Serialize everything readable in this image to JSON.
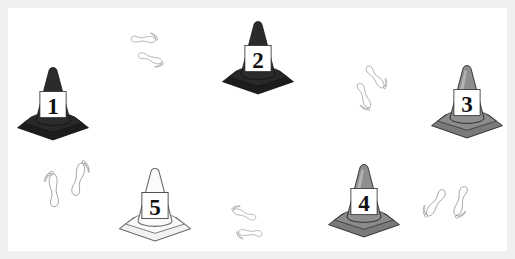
{
  "scene": {
    "title": "Numbered traffic cones and footprint pairs",
    "background_color": "#ffffff",
    "border_color": "#efefef",
    "border_width_px": 8,
    "width_px": 515,
    "height_px": 259
  },
  "cones": [
    {
      "id": "cone-1",
      "label": "1",
      "shade": "dark",
      "body_color": "#2b2b2b",
      "base_color": "#1c1c1c",
      "label_bg": "#ffffff",
      "x": 14,
      "y": 66,
      "w": 78,
      "h": 74
    },
    {
      "id": "cone-2",
      "label": "2",
      "shade": "dark",
      "body_color": "#2b2b2b",
      "base_color": "#1c1c1c",
      "label_bg": "#ffffff",
      "x": 219,
      "y": 20,
      "w": 78,
      "h": 74
    },
    {
      "id": "cone-3",
      "label": "3",
      "shade": "gray",
      "body_color": "#8e8e8e",
      "base_color": "#7a7a7a",
      "label_bg": "#ffffff",
      "x": 428,
      "y": 64,
      "w": 78,
      "h": 74
    },
    {
      "id": "cone-4",
      "label": "4",
      "shade": "gray",
      "body_color": "#8e8e8e",
      "base_color": "#7a7a7a",
      "label_bg": "#ffffff",
      "x": 325,
      "y": 163,
      "w": 78,
      "h": 74
    },
    {
      "id": "cone-5",
      "label": "5",
      "shade": "light",
      "body_color": "#fbfbfb",
      "base_color": "#f2f2f2",
      "label_bg": "#ffffff",
      "x": 116,
      "y": 167,
      "w": 78,
      "h": 74
    }
  ],
  "footprint_pairs": [
    {
      "id": "footprints-top-left",
      "direction": "right",
      "rotation_deg": 100,
      "x": 98,
      "y": 28,
      "w": 84,
      "h": 54,
      "outline_color": "#4a4a4a",
      "fill_color": "#ffffff"
    },
    {
      "id": "footprints-top-right",
      "direction": "down-right",
      "rotation_deg": 150,
      "x": 318,
      "y": 56,
      "w": 84,
      "h": 58,
      "outline_color": "#4a4a4a",
      "fill_color": "#ffffff"
    },
    {
      "id": "footprints-bottom-left",
      "direction": "up",
      "rotation_deg": 5,
      "x": 38,
      "y": 157,
      "w": 74,
      "h": 72,
      "outline_color": "#4a4a4a",
      "fill_color": "#ffffff"
    },
    {
      "id": "footprints-bottom-middle",
      "direction": "left",
      "rotation_deg": 282,
      "x": 213,
      "y": 192,
      "w": 82,
      "h": 52,
      "outline_color": "#4a4a4a",
      "fill_color": "#ffffff"
    },
    {
      "id": "footprints-bottom-right",
      "direction": "down-left",
      "rotation_deg": 205,
      "x": 410,
      "y": 152,
      "w": 66,
      "h": 80,
      "outline_color": "#4a4a4a",
      "fill_color": "#ffffff"
    }
  ]
}
